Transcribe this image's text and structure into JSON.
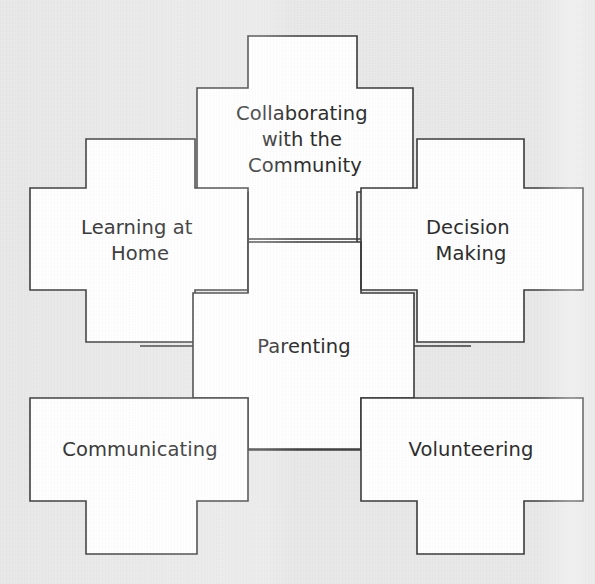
{
  "diagram": {
    "type": "interlocking-puzzle-pieces",
    "title_visible": false,
    "background_color": "#e9e9e9",
    "piece_fill": "#ffffff",
    "piece_stroke": "#3a3a3a",
    "text_color": "#2b2b2b",
    "pieces": [
      {
        "id": "collaborating-with-the-community",
        "name": "Collaborating with the Community",
        "lines": [
          "Collaborating",
          "with the",
          "Community"
        ],
        "position": "top-center",
        "cx": 305,
        "cy": 140,
        "label_dy": -26
      },
      {
        "id": "learning-at-home",
        "name": "Learning at Home",
        "lines": [
          "Learning at",
          "Home"
        ],
        "position": "middle-left",
        "cx": 140,
        "cy": 239,
        "label_dy": -14
      },
      {
        "id": "decision-making",
        "name": "Decision Making",
        "lines": [
          "Decision",
          "Making"
        ],
        "position": "middle-right",
        "cx": 471,
        "cy": 239,
        "label_dy": -14
      },
      {
        "id": "parenting",
        "name": "Parenting",
        "lines": [
          "Parenting"
        ],
        "position": "center",
        "cx": 305,
        "cy": 346,
        "label_dy": 0
      },
      {
        "id": "communicating",
        "name": "Communicating",
        "lines": [
          "Communicating"
        ],
        "position": "bottom-left",
        "cx": 140,
        "cy": 450,
        "label_dy": 0
      },
      {
        "id": "volunteering",
        "name": "Volunteering",
        "lines": [
          "Volunteering"
        ],
        "position": "bottom-right",
        "cx": 471,
        "cy": 450,
        "label_dy": 0
      }
    ]
  }
}
